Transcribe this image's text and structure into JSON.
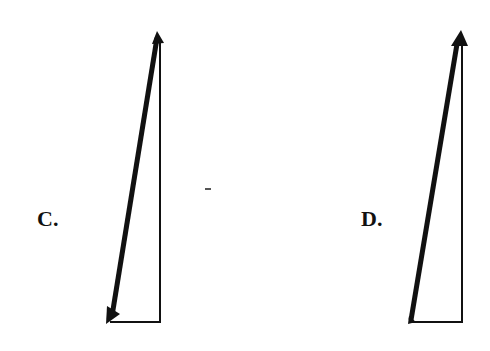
{
  "figure": {
    "options": [
      {
        "id": "C",
        "label": "C.",
        "description": "Right triangle of vectors: thin vertical side pointing up, thin horizontal base, thick hypotenuse with arrowhead at the bottom-left",
        "resultant_arrow_at": "bottom-left",
        "component_arrow_at": "top"
      },
      {
        "id": "D",
        "label": "D.",
        "description": "Right triangle of vectors: thin vertical side, thin horizontal base, thick hypotenuse with arrowhead at the top",
        "resultant_arrow_at": "top",
        "component_arrow_at": "bottom-left"
      }
    ],
    "stroke_color": "#111111"
  }
}
